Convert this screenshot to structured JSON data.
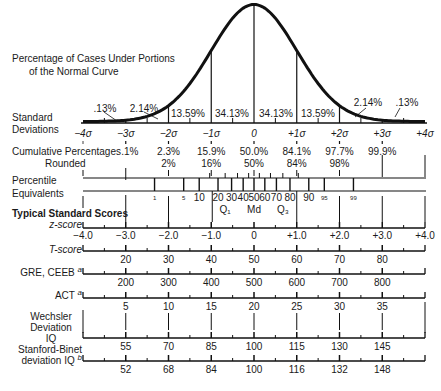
{
  "diagram": {
    "title_line1": "Percentage of Cases Under Portions",
    "title_line2": "of the Normal Curve",
    "curve_percentages": [
      ".13%",
      "2.14%",
      "13.59%",
      "34.13%",
      "34.13%",
      "13.59%",
      "2.14%",
      ".13%"
    ],
    "standard_deviations": {
      "label_line1": "Standard",
      "label_line2": "Deviations",
      "ticks": [
        "−4σ",
        "−3σ",
        "−2σ",
        "−1σ",
        "0",
        "+1σ",
        "+2σ",
        "+3σ",
        "+4σ"
      ]
    },
    "cumulative_percentages": {
      "label": "Cumulative Percentages",
      "label_rounded": "Rounded",
      "values": [
        ".1%",
        "2.3%",
        "15.9%",
        "50.0%",
        "84.1%",
        "97.7%",
        "99.9%"
      ],
      "rounded": [
        "2%",
        "16%",
        "50%",
        "84%",
        "98%"
      ]
    },
    "percentile_equivalents": {
      "label_line1": "Percentile",
      "label_line2": "Equivalents",
      "values": [
        "1",
        "5",
        "10",
        "20",
        "30",
        "40",
        "50",
        "60",
        "70",
        "80",
        "90",
        "95",
        "99"
      ],
      "quartiles": [
        "Q₁",
        "Md",
        "Q₃"
      ]
    },
    "typical_standard_scores": {
      "heading": "Typical Standard Scores",
      "z_score": {
        "label": "z-score",
        "values": [
          "−4.0",
          "−3.0",
          "−2.0",
          "−1.0",
          "0",
          "+1.0",
          "+2.0",
          "+3.0",
          "+4.0"
        ]
      },
      "t_score": {
        "label": "T-score",
        "values": [
          "20",
          "30",
          "40",
          "50",
          "60",
          "70",
          "80"
        ]
      },
      "gre_ceeb": {
        "label": "GRE, CEEB",
        "footnote": "a",
        "values": [
          "200",
          "300",
          "400",
          "500",
          "600",
          "700",
          "800"
        ]
      },
      "act": {
        "label": "ACT",
        "footnote": "a",
        "values": [
          "5",
          "10",
          "15",
          "20",
          "25",
          "30",
          "35"
        ]
      },
      "wechsler": {
        "label_line1": "Wechsler",
        "label_line2": "Deviation",
        "label_line3": "IQ",
        "values": [
          "55",
          "70",
          "85",
          "100",
          "115",
          "130",
          "145"
        ]
      },
      "stanford_binet": {
        "label_line1": "Stanford-Binet",
        "label_line2": "deviation IQ",
        "footnote": "b",
        "values": [
          "52",
          "68",
          "84",
          "100",
          "116",
          "132",
          "148"
        ]
      }
    }
  }
}
